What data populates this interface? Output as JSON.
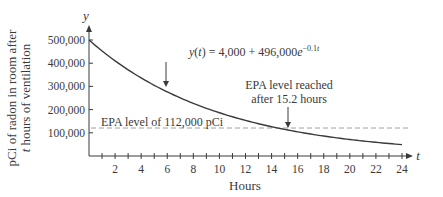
{
  "chart_data": {
    "type": "line",
    "title": "",
    "xlabel": "Hours",
    "x_axis_symbol": "t",
    "ylabel_lines": [
      "pCi of radon in room after",
      "t hours of ventilation"
    ],
    "y_axis_symbol": "y",
    "xlim": [
      0,
      24
    ],
    "ylim": [
      0,
      500000
    ],
    "x_ticks": [
      1,
      2,
      3,
      4,
      5,
      6,
      7,
      8,
      9,
      10,
      11,
      12,
      13,
      14,
      15,
      16,
      17,
      18,
      19,
      20,
      21,
      22,
      23,
      24
    ],
    "x_tick_labels": [
      {
        "value": 2,
        "label": "2"
      },
      {
        "value": 4,
        "label": "4"
      },
      {
        "value": 6,
        "label": "6"
      },
      {
        "value": 8,
        "label": "8"
      },
      {
        "value": 10,
        "label": "10"
      },
      {
        "value": 12,
        "label": "12"
      },
      {
        "value": 14,
        "label": "14"
      },
      {
        "value": 16,
        "label": "16"
      },
      {
        "value": 18,
        "label": "18"
      },
      {
        "value": 20,
        "label": "20"
      },
      {
        "value": 22,
        "label": "22"
      },
      {
        "value": 24,
        "label": "24"
      }
    ],
    "y_tick_labels": [
      {
        "value": 100000,
        "label": "100,000"
      },
      {
        "value": 200000,
        "label": "200,000"
      },
      {
        "value": 300000,
        "label": "300,000"
      },
      {
        "value": 400000,
        "label": "400,000"
      },
      {
        "value": 500000,
        "label": "500,000"
      }
    ],
    "grid": false,
    "series": [
      {
        "name": "y(t) = 4,000 + 496,000e^(-0.1t)",
        "formula": {
          "a": 4000,
          "b": 496000,
          "k": -0.1
        },
        "x": [
          0,
          2,
          4,
          6,
          8,
          10,
          12,
          14,
          15.2,
          16,
          18,
          20,
          22,
          24
        ],
        "values": [
          500000,
          410088,
          336483,
          276221,
          226862,
          186466,
          153396,
          126322,
          112022,
          104157,
          86010,
          71126,
          58960,
          48991
        ]
      }
    ],
    "reference_lines": [
      {
        "orientation": "horizontal",
        "value": 112000,
        "style": "dashed",
        "label": "EPA level of 112,000 pCi"
      }
    ],
    "annotations": [
      {
        "text_parts": [
          "y(t) = 4,000 + 496,000e",
          "−0.1t"
        ],
        "arrow_to": {
          "x": 6,
          "y": 276221
        }
      },
      {
        "lines": [
          "EPA level reached",
          "after 15.2 hours"
        ],
        "arrow_to": {
          "x": 15.2,
          "y": 112000
        }
      }
    ]
  },
  "colors": {
    "axis": "#3a3a3a",
    "curve": "#3a3a3a",
    "dashed": "#a0a0a0",
    "text": "#3a3a3a"
  }
}
